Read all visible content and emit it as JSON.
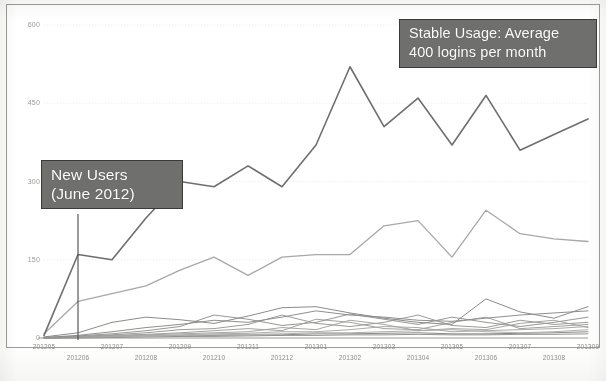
{
  "chart_data": {
    "type": "line",
    "title": "",
    "subtitle": "",
    "xlabel": "",
    "ylabel": "",
    "ylim": [
      0,
      600
    ],
    "yticks": [
      0,
      150,
      300,
      450,
      600
    ],
    "ytick_labels": [
      "0",
      "150",
      "300",
      "450",
      "600"
    ],
    "grid": true,
    "grid_axis": "y",
    "legend": "none",
    "categories": [
      "201205",
      "201206",
      "201207",
      "201208",
      "201209",
      "201210",
      "201211",
      "201212",
      "201301",
      "201302",
      "201303",
      "201304",
      "201305",
      "201306",
      "201307",
      "201308",
      "201309"
    ],
    "x": [
      "201205",
      "201206",
      "201207",
      "201208",
      "201209",
      "201210",
      "201211",
      "201212",
      "201301",
      "201302",
      "201303",
      "201304",
      "201305",
      "201306",
      "201307",
      "201308",
      "201309"
    ],
    "series": [
      {
        "name": "Total logins",
        "color": "#6e6e6c",
        "width": 1.6,
        "values": [
          5,
          160,
          150,
          230,
          300,
          290,
          330,
          290,
          370,
          520,
          405,
          460,
          370,
          465,
          360,
          390,
          420
        ]
      },
      {
        "name": "Secondary group",
        "color": "#a8a8a6",
        "width": 1.3,
        "values": [
          8,
          70,
          85,
          100,
          130,
          155,
          120,
          155,
          160,
          160,
          215,
          225,
          155,
          245,
          200,
          190,
          185
        ]
      },
      {
        "name": "Cohort A",
        "color": "#8c8c8a",
        "width": 1.0,
        "values": [
          2,
          10,
          30,
          40,
          35,
          28,
          42,
          58,
          60,
          48,
          38,
          30,
          26,
          75,
          50,
          38,
          60
        ]
      },
      {
        "name": "Cohort B",
        "color": "#8f8f8d",
        "width": 1.0,
        "values": [
          1,
          5,
          12,
          20,
          26,
          34,
          30,
          40,
          52,
          44,
          40,
          34,
          32,
          38,
          44,
          48,
          52
        ]
      },
      {
        "name": "Cohort C",
        "color": "#969694",
        "width": 1.0,
        "values": [
          1,
          4,
          8,
          14,
          22,
          44,
          36,
          24,
          30,
          46,
          36,
          26,
          40,
          30,
          22,
          30,
          40
        ]
      },
      {
        "name": "Cohort D",
        "color": "#9b9b99",
        "width": 1.0,
        "values": [
          0,
          3,
          6,
          10,
          16,
          18,
          26,
          44,
          28,
          22,
          30,
          44,
          24,
          20,
          34,
          26,
          30
        ]
      },
      {
        "name": "Cohort E",
        "color": "#a2a2a0",
        "width": 1.0,
        "values": [
          0,
          2,
          5,
          7,
          10,
          14,
          18,
          14,
          36,
          30,
          18,
          16,
          30,
          40,
          18,
          22,
          26
        ]
      },
      {
        "name": "Cohort F",
        "color": "#a6a6a4",
        "width": 1.0,
        "values": [
          0,
          2,
          4,
          6,
          8,
          10,
          12,
          20,
          16,
          34,
          26,
          14,
          18,
          16,
          28,
          34,
          20
        ]
      },
      {
        "name": "Cohort G",
        "color": "#ababa9",
        "width": 1.0,
        "values": [
          0,
          1,
          3,
          5,
          6,
          8,
          9,
          12,
          12,
          16,
          22,
          20,
          12,
          14,
          16,
          18,
          22
        ]
      },
      {
        "name": "Cohort H",
        "color": "#b0b0ae",
        "width": 1.0,
        "values": [
          0,
          1,
          2,
          3,
          5,
          6,
          7,
          8,
          10,
          10,
          12,
          14,
          16,
          12,
          10,
          12,
          16
        ]
      },
      {
        "name": "Cohort I",
        "color": "#8a8a88",
        "width": 1.0,
        "values": [
          0,
          1,
          2,
          4,
          4,
          5,
          6,
          6,
          8,
          8,
          9,
          10,
          8,
          8,
          9,
          10,
          12
        ]
      },
      {
        "name": "Cohort J",
        "color": "#949492",
        "width": 1.0,
        "values": [
          0,
          0,
          1,
          2,
          3,
          3,
          4,
          5,
          5,
          6,
          6,
          7,
          6,
          6,
          7,
          7,
          8
        ]
      }
    ],
    "annotations": [
      {
        "id": "new-users",
        "lines": [
          "New Users",
          "(June 2012)"
        ],
        "target_category": "201206",
        "target_value": 0,
        "box_color": "#6f6f6e",
        "text_color": "#ffffff",
        "leader": "vertical-down"
      },
      {
        "id": "stable-usage",
        "lines": [
          "Stable Usage: Average",
          "400 logins per month"
        ],
        "target_category": "201302",
        "target_value": 520,
        "box_color": "#6f6f6e",
        "text_color": "#ffffff",
        "leader": "none"
      }
    ]
  },
  "axes": {
    "y": {
      "ticks": [
        "600",
        "450",
        "300",
        "150",
        "0"
      ]
    },
    "x": {
      "ticks": [
        "201205",
        "201206",
        "201207",
        "201208",
        "201209",
        "201210",
        "201211",
        "201212",
        "201301",
        "201302",
        "201303",
        "201304",
        "201305",
        "201306",
        "201307",
        "201308",
        "201309"
      ]
    }
  },
  "annotations": {
    "new_users": {
      "line1": "New Users",
      "line2": "(June 2012)"
    },
    "stable_usage": {
      "line1": "Stable Usage: Average",
      "line2": "400 logins per month"
    }
  },
  "colors": {
    "annotation_box": "#6f6f6e",
    "annotation_border": "#3a3a39",
    "annotation_text": "#ffffff",
    "primary_series": "#6e6e6c",
    "secondary_series": "#a8a8a6",
    "grid": "#e6e6e4",
    "axis_text": "#9a9a98",
    "frame": "#9b9b98"
  }
}
